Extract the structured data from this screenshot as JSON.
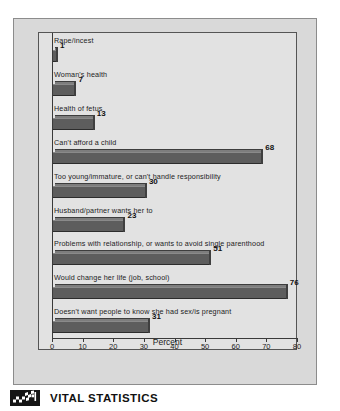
{
  "chart_data": {
    "type": "bar",
    "orientation": "horizontal",
    "title": "",
    "xlabel": "Percent",
    "ylabel": "",
    "xlim": [
      0,
      85
    ],
    "xticks": [
      0,
      10,
      20,
      30,
      40,
      50,
      60,
      70,
      80
    ],
    "grid": false,
    "legend": null,
    "categories": [
      "Rape/incest",
      "Woman's health",
      "Health of fetus",
      "Can't afford a child",
      "Too young/immature, or can't handle responsibility",
      "Husband/partner wants her to",
      "Problems with relationship, or wants to avoid single parenthood",
      "Would change her life (job, school)",
      "Doesn't want people to know she had sex/is pregnant"
    ],
    "values": [
      1,
      7,
      13,
      68,
      30,
      23,
      51,
      76,
      31
    ],
    "value_labels": [
      "1",
      "7",
      "13",
      "68",
      "30",
      "23",
      "51",
      "76",
      "31"
    ],
    "bar_color": "#5d5d5d",
    "plot_background": "#e2e2e2",
    "card_background": "#d9d9d9"
  },
  "axis": {
    "tick_labels": [
      "0",
      "10",
      "20",
      "30",
      "40",
      "50",
      "60",
      "70",
      "80"
    ],
    "title": "Percent"
  },
  "footer": {
    "brand": "VITAL STATISTICS",
    "logo_icon": "checkered-flag-icon"
  }
}
